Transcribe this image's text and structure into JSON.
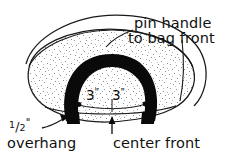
{
  "figure": {
    "kind": "sewing-pattern-diagram",
    "background_color": "#ffffff",
    "ink_color": "#111111",
    "handle_color": "#000000",
    "fill_texture_color": "#9a9a9a"
  },
  "annotations": {
    "pin_handle_line1": "pin handle",
    "pin_handle_line2": "to bag front",
    "half_inch_numerator": "1",
    "half_inch_slash": "/",
    "half_inch_denominator": "2",
    "half_inch_unit": "\"",
    "overhang": "overhang",
    "center_front": "center front",
    "dim_left": "3",
    "dim_left_unit": "\"",
    "dim_right": "3",
    "dim_right_unit": "\""
  },
  "measurements": [
    {
      "label": "3\"",
      "from": "center front",
      "to": "left handle strap"
    },
    {
      "label": "3\"",
      "from": "center front",
      "to": "right handle strap"
    },
    {
      "label": "1/2\"",
      "description": "overhang of handle below bag front edge"
    }
  ],
  "parts": {
    "bag_body": "bag-body",
    "bag_top_rim": "bag-top-rim",
    "handle": "handle",
    "center_front_tick": "center-front-tick",
    "measure_line": "measure-line",
    "left_dot": "left-measure-dot",
    "right_dot": "right-measure-dot"
  }
}
